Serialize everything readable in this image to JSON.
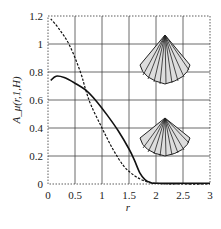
{
  "chart_data": {
    "type": "line",
    "title": "",
    "xlabel": "r",
    "ylabel": "A_μ(r,1,H)",
    "xlim": [
      0,
      3
    ],
    "ylim": [
      0,
      1.2
    ],
    "grid": true,
    "x_ticks": [
      "0",
      "0.5",
      "1",
      "1.5",
      "2",
      "2.5",
      "3"
    ],
    "y_ticks": [
      "0",
      "0.2",
      "0.4",
      "0.6",
      "0.8",
      "1",
      "1.2"
    ],
    "series": [
      {
        "name": "solid (cone, upper inset)",
        "style": "solid",
        "x": [
          0.05,
          0.15,
          0.3,
          0.5,
          0.7,
          0.9,
          1.1,
          1.3,
          1.5,
          1.6,
          1.7,
          1.8,
          1.9,
          2.0,
          2.5,
          3.0
        ],
        "y": [
          0.74,
          0.77,
          0.76,
          0.72,
          0.67,
          0.59,
          0.49,
          0.38,
          0.25,
          0.17,
          0.08,
          0.03,
          0.01,
          0.005,
          0.005,
          0.005
        ]
      },
      {
        "name": "dashed (cone, lower inset)",
        "style": "dashed",
        "x": [
          0.05,
          0.2,
          0.4,
          0.6,
          0.7,
          0.8,
          1.0,
          1.2,
          1.4,
          1.6,
          1.8,
          2.0,
          2.5,
          3.0
        ],
        "y": [
          1.18,
          1.11,
          0.99,
          0.8,
          0.67,
          0.56,
          0.4,
          0.25,
          0.13,
          0.06,
          0.02,
          0.005,
          0.0,
          0.0
        ]
      }
    ],
    "insets": [
      "cone-icon-upper",
      "cone-icon-lower"
    ]
  }
}
